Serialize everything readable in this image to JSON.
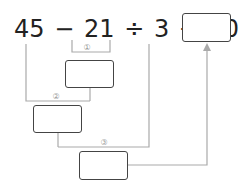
{
  "equation": {
    "terms": [
      "45",
      "−",
      "21",
      "÷",
      "3",
      "+",
      "10",
      "="
    ],
    "text": "45 − 21 ÷ 3 + 10 ="
  },
  "steps": [
    {
      "label": "①",
      "operation": "21 ÷ 3"
    },
    {
      "label": "②",
      "operation": "45 − ①"
    },
    {
      "label": "③",
      "operation": "② + 10"
    }
  ],
  "answer_box": {
    "value": ""
  },
  "colors": {
    "text": "#222222",
    "box_border": "#444444",
    "lines": "#aaaaaa"
  }
}
